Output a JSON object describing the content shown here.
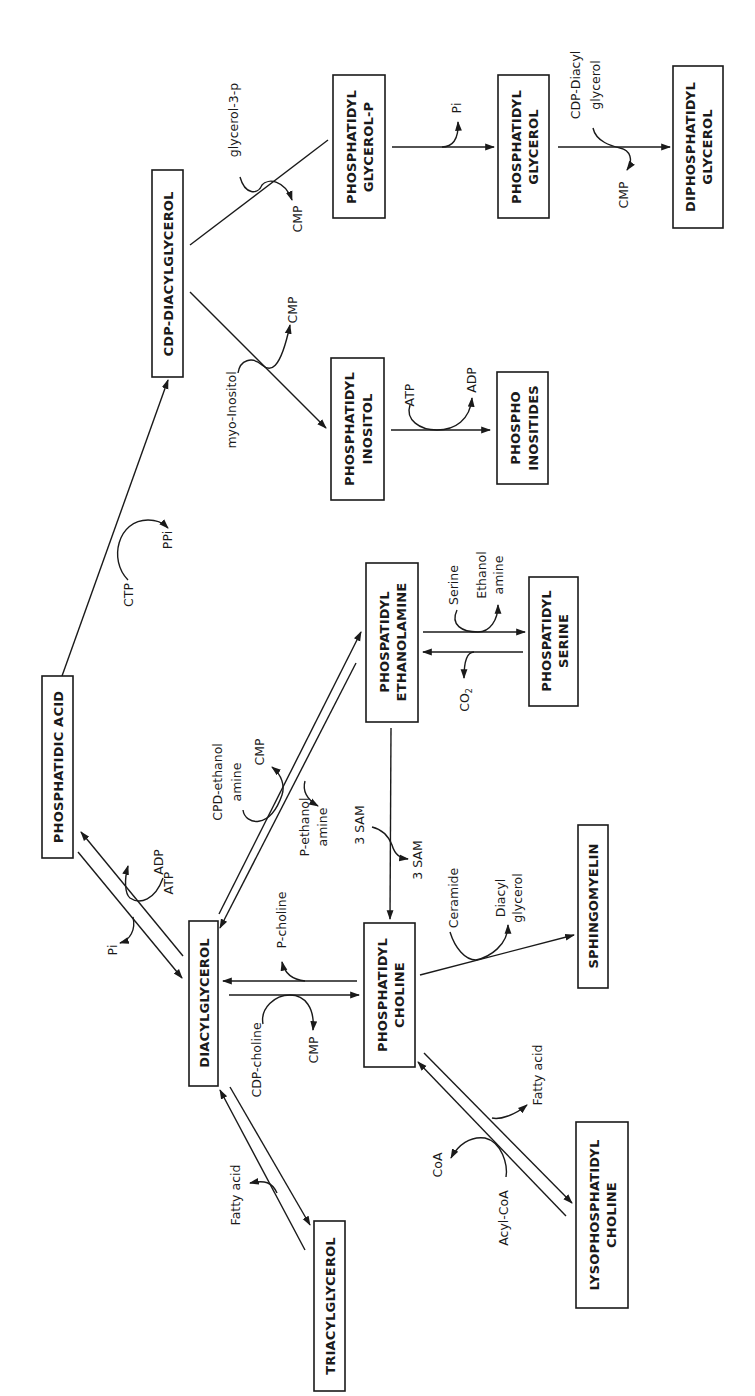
{
  "diagram": {
    "orientation": "rotated -90 degrees (reads bottom-to-top)",
    "nodes": {
      "phosphatidic_acid": {
        "line1": "PHOSPHATIDIC ACID",
        "line2": ""
      },
      "cdp_diacylglycerol": {
        "line1": "CDP-DIACYLGLYCEROL",
        "line2": ""
      },
      "phosphatidyl_glycerol_p": {
        "line1": "PHOSPHATIDYL",
        "line2": "GLYCEROL-P"
      },
      "phosphatidyl_glycerol": {
        "line1": "PHOSPHATIDYL",
        "line2": "GLYCEROL"
      },
      "diphosphatidyl_glycerol": {
        "line1": "DIPHOSPHATIDYL",
        "line2": "GLYCEROL"
      },
      "phosphatidyl_inositol": {
        "line1": "PHOSPHATIDYL",
        "line2": "INOSITOL"
      },
      "phosphoinositides": {
        "line1": "PHOSPHO",
        "line2": "INOSITIDES"
      },
      "phosphatidyl_ethanolamine": {
        "line1": "PHOSPATIDYL",
        "line2": "ETHANOLAMINE"
      },
      "phosphatidyl_serine": {
        "line1": "PHOSPATIDYL",
        "line2": "SERINE"
      },
      "diacylglycerol": {
        "line1": "DIACYLGLYCEROL",
        "line2": ""
      },
      "phosphatidyl_choline": {
        "line1": "PHOSPHATIDYL",
        "line2": "CHOLINE"
      },
      "sphingomyelin": {
        "line1": "SPHINGOMYELIN",
        "line2": ""
      },
      "triacylglycerol": {
        "line1": "TRIACYLGLYCEROL",
        "line2": ""
      },
      "lysophosphatidyl_choline": {
        "line1": "LYSOPHOSPHATIDYL",
        "line2": "CHOLINE"
      }
    },
    "labels": {
      "glycerol_3_p": "glycerol-3-p",
      "cmp_pgp": "CMP",
      "pi_pg": "Pi",
      "cdp_diacyl": "CDP-Diacyl",
      "glycerol": "glycerol",
      "cmp_dpg": "CMP",
      "myo_inositol": "myo-Inositol",
      "cmp_pi": "CMP",
      "atp_pi": "ATP",
      "adp_pi": "ADP",
      "ctp": "CTP",
      "ppi": "PPi",
      "serine": "Serine",
      "ethanol": "Ethanol",
      "amine": "amine",
      "co2": "CO",
      "co2_sub": "2",
      "cpd_ethanol": "CPD-ethanol",
      "cpd_amine": "amine",
      "cmp_pe": "CMP",
      "p_ethanol": "P-ethanol",
      "p_amine": "amine",
      "sam_in": "3 SAM",
      "sam_out": "3 SAM",
      "adp_pa": "ADP",
      "atp_pa": "ATP",
      "pi_pa": "Pi",
      "p_choline": "P-choline",
      "cdp_choline": "CDP-choline",
      "cmp_pc": "CMP",
      "ceramide": "Ceramide",
      "diacyl": "Diacyl",
      "glycerol_sm": "glycerol",
      "fatty_acid_tag": "Fatty acid",
      "fatty_acid_lpc": "Fatty acid",
      "coa": "CoA",
      "acyl_coa": "Acyl-CoA"
    },
    "colors": {
      "ink": "#1a1a1a",
      "background": "#ffffff"
    }
  }
}
